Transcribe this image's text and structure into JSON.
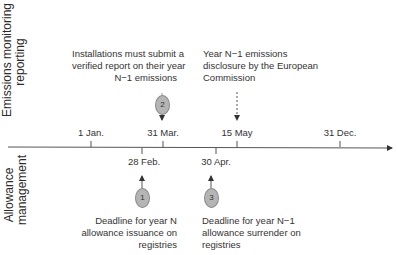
{
  "sections": {
    "top_label": "Emissions monitoring and reporting",
    "top_label_lines": [
      "Emissions monitoring and",
      "reporting"
    ],
    "bottom_label_lines": [
      "Allowance",
      "management"
    ]
  },
  "timeline": {
    "ticks_above": [
      {
        "label": "1 Jan.",
        "x": 91
      },
      {
        "label": "31 Mar.",
        "x": 163
      },
      {
        "label": "15 May",
        "x": 237
      },
      {
        "label": "31 Dec.",
        "x": 340
      }
    ],
    "ticks_below": [
      {
        "label": "28 Feb.",
        "x": 142
      },
      {
        "label": "30 Apr.",
        "x": 216
      }
    ]
  },
  "events": {
    "e1": {
      "number": "1",
      "lines": [
        "Deadline for year N",
        "allowance issuance on",
        "registries"
      ]
    },
    "e2": {
      "number": "2",
      "lines": [
        "Installations must submit a",
        "verified report on their year",
        "N−1 emissions"
      ]
    },
    "e3": {
      "number": "3",
      "lines": [
        "Deadline for year N−1",
        "allowance surrender on",
        "registries"
      ]
    },
    "ec": {
      "lines": [
        "Year N−1 emissions",
        "disclosure by the European",
        "Commission"
      ]
    }
  },
  "colors": {
    "line": "#555555",
    "circle_fill": "#b5b5b5",
    "circle_stroke": "#8a8a8a"
  }
}
